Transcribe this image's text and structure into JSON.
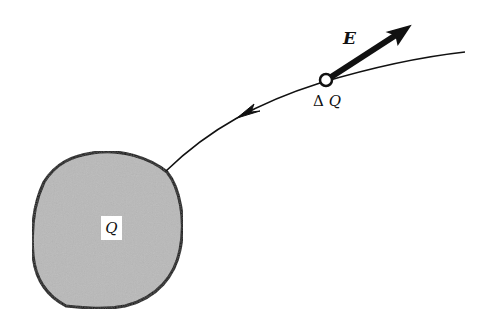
{
  "diagram": {
    "type": "electric field line from charged body to test charge",
    "labels": {
      "field_vector": "E",
      "test_charge_delta": "Δ",
      "test_charge_symbol": "Q",
      "source_charge": "Q"
    },
    "colors": {
      "background": "#ffffff",
      "body_fill": "#b9b9b9",
      "stroke": "#111111"
    },
    "elements": {
      "source_body": {
        "center": [
          101,
          229
        ],
        "approx_radius": 78
      },
      "test_charge": {
        "center": [
          326,
          80
        ],
        "radius": 6
      },
      "field_arrow": {
        "from": [
          326,
          80
        ],
        "to": [
          410,
          26
        ]
      },
      "field_line": {
        "from": [
          165,
          170
        ],
        "to": [
          465,
          52
        ],
        "arrow_direction": "toward source body"
      }
    }
  }
}
